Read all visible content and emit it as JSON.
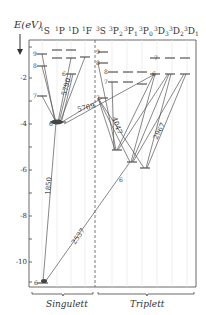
{
  "axis": {
    "title": "E(eV)",
    "ticks": [
      "-2",
      "-4",
      "-6",
      "-8",
      "-10"
    ],
    "tick_values": [
      -2,
      -4,
      -6,
      -8,
      -10
    ]
  },
  "columns": {
    "singlet": [
      "1S",
      "1P",
      "1D",
      "1F"
    ],
    "triplet": [
      "3S",
      "3P2",
      "3P1",
      "3P0",
      "3D3",
      "3D2",
      "3D1"
    ]
  },
  "column_labels": {
    "singlet": [
      {
        "sup": "1",
        "base": "S",
        "sub": ""
      },
      {
        "sup": "1",
        "base": "P",
        "sub": ""
      },
      {
        "sup": "1",
        "base": "D",
        "sub": ""
      },
      {
        "sup": "1",
        "base": "F",
        "sub": ""
      }
    ],
    "triplet": [
      {
        "sup": "3",
        "base": "S",
        "sub": ""
      },
      {
        "sup": "3",
        "base": "P",
        "sub": "2"
      },
      {
        "sup": "3",
        "base": "P",
        "sub": "1"
      },
      {
        "sup": "3",
        "base": "P",
        "sub": "0"
      },
      {
        "sup": "3",
        "base": "D",
        "sub": "3"
      },
      {
        "sup": "3",
        "base": "D",
        "sub": "2"
      },
      {
        "sup": "3",
        "base": "D",
        "sub": "1"
      }
    ]
  },
  "level_labels": {
    "s1_9": "9",
    "s1_8": "8",
    "s1_7": "7",
    "s1_6": "6",
    "p1_6": "6",
    "d1_6": "6",
    "t_s_9": "9",
    "t_s_8": "8",
    "t_s_7": "7",
    "t_p_8": "8",
    "t_p_7": "7",
    "t_p_6": "6",
    "t_d_7": "7",
    "t_d_6": "6"
  },
  "transitions": {
    "w5790": "5790",
    "w5769": "5769",
    "w4047": "4047",
    "w2967": "2967",
    "w1850": "1850",
    "w2537": "2537"
  },
  "groups": {
    "singlet": "Singulett",
    "triplet": "Triplett"
  },
  "colors": {
    "line": "#555555",
    "frame": "#444444",
    "dashed_divider": "#555555"
  }
}
